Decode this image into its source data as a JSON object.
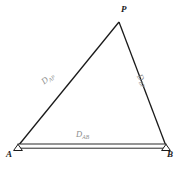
{
  "figure": {
    "type": "geometry-diagram",
    "background_color": "#ffffff",
    "stroke_color": "#1a1a1a",
    "label_color": "#8d8d8d",
    "vertex_label_color": "#1a1a1a",
    "caption": ""
  },
  "vertices": {
    "a": {
      "label": "A",
      "x": 18,
      "y": 146,
      "marker": "triangle-marker"
    },
    "b": {
      "label": "B",
      "x": 166,
      "y": 146,
      "marker": "triangle-marker"
    },
    "p": {
      "label": "P",
      "x": 119,
      "y": 22,
      "marker": "none"
    }
  },
  "sides": {
    "ap": {
      "label_base": "D",
      "label_sub": "AP",
      "from": "A",
      "to": "P"
    },
    "bp": {
      "label_base": "D",
      "label_sub": "BP",
      "from": "B",
      "to": "P"
    },
    "ab": {
      "label_base": "D",
      "label_sub": "AB",
      "from": "A",
      "to": "B",
      "style": "double-line-baseline"
    }
  }
}
